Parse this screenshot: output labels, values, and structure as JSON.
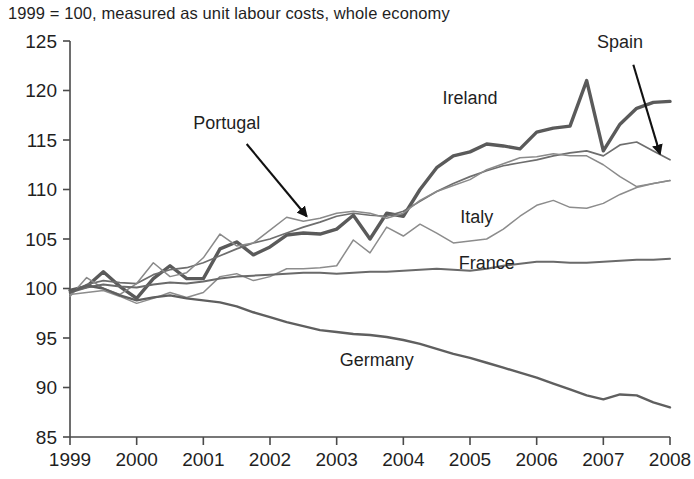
{
  "chart": {
    "title": "1999 = 100, measured as unit labour costs, whole economy"
  },
  "chart_data": {
    "type": "line",
    "title": "1999 = 100, measured as unit labour costs, whole economy",
    "xlabel": "",
    "ylabel": "",
    "xlim": [
      1999,
      2008
    ],
    "ylim": [
      85,
      125
    ],
    "yticks": [
      85,
      90,
      95,
      100,
      105,
      110,
      115,
      120,
      125
    ],
    "xticks": [
      1999,
      2000,
      2001,
      2002,
      2003,
      2004,
      2005,
      2006,
      2007,
      2008
    ],
    "grid": false,
    "legend": "inline-annotations",
    "x": [
      1999,
      1999.25,
      1999.5,
      1999.75,
      2000,
      2000.25,
      2000.5,
      2000.75,
      2001,
      2001.25,
      2001.5,
      2001.75,
      2002,
      2002.25,
      2002.5,
      2002.75,
      2003,
      2003.25,
      2003.5,
      2003.75,
      2004,
      2004.25,
      2004.5,
      2004.75,
      2005,
      2005.25,
      2005.5,
      2005.75,
      2006,
      2006.25,
      2006.5,
      2006.75,
      2007,
      2007.25,
      2007.5,
      2007.75,
      2008
    ],
    "series": [
      {
        "name": "Ireland",
        "color": "#5a5a5a",
        "width": 3.4,
        "label_x": 2005.0,
        "label_y": 118.6,
        "values": [
          99.8,
          100.2,
          101.7,
          100.2,
          99.0,
          101.0,
          102.3,
          101.0,
          101.0,
          104.0,
          104.7,
          103.4,
          104.2,
          105.4,
          105.6,
          105.5,
          106.0,
          107.4,
          105.0,
          107.6,
          107.3,
          110.0,
          112.2,
          113.4,
          113.8,
          114.6,
          114.4,
          114.1,
          115.8,
          116.2,
          116.4,
          121.0,
          113.9,
          116.6,
          118.2,
          118.8,
          118.9
        ]
      },
      {
        "name": "Spain",
        "color": "#6e6e6e",
        "width": 1.7,
        "label_x": 2007.25,
        "label_y": 124.3,
        "values": [
          99.5,
          100.4,
          100.8,
          100.6,
          100.5,
          101.4,
          101.9,
          102.1,
          102.6,
          103.3,
          104.0,
          104.6,
          105.0,
          105.6,
          106.2,
          106.7,
          107.3,
          107.6,
          107.4,
          107.3,
          107.8,
          108.8,
          109.8,
          110.6,
          111.3,
          111.9,
          112.4,
          112.7,
          113.0,
          113.4,
          113.7,
          113.9,
          113.4,
          114.5,
          114.8,
          113.9,
          113.0
        ]
      },
      {
        "name": "Portugal",
        "color": "#8a8a8a",
        "width": 1.5,
        "label_x": 2001.35,
        "label_y": 116.1,
        "values": [
          99.2,
          101.1,
          100.0,
          99.4,
          100.5,
          102.6,
          101.2,
          101.6,
          103.1,
          105.5,
          104.3,
          104.6,
          105.9,
          107.2,
          106.8,
          107.1,
          107.6,
          107.8,
          107.6,
          107.1,
          107.6,
          108.9,
          109.8,
          110.4,
          111.0,
          112.0,
          112.6,
          113.2,
          113.3,
          113.6,
          113.4,
          113.4,
          112.5,
          111.3,
          110.3,
          110.6,
          110.9
        ]
      },
      {
        "name": "Italy",
        "color": "#8c8c8c",
        "width": 1.5,
        "label_x": 2005.1,
        "label_y": 106.6,
        "values": [
          99.4,
          99.6,
          99.8,
          99.2,
          98.5,
          99.0,
          99.6,
          99.1,
          99.6,
          101.2,
          101.5,
          100.8,
          101.2,
          102.0,
          102.0,
          102.1,
          102.3,
          104.9,
          103.6,
          106.2,
          105.3,
          106.5,
          105.6,
          104.6,
          104.8,
          105.0,
          106.0,
          107.3,
          108.4,
          108.9,
          108.2,
          108.1,
          108.6,
          109.5,
          110.2,
          110.6,
          110.9
        ]
      },
      {
        "name": "France",
        "color": "#6a6a6a",
        "width": 2.0,
        "label_x": 2005.25,
        "label_y": 102.0,
        "values": [
          99.6,
          100.1,
          100.4,
          100.2,
          100.1,
          100.4,
          100.6,
          100.5,
          100.7,
          101.0,
          101.2,
          101.3,
          101.4,
          101.5,
          101.6,
          101.6,
          101.5,
          101.6,
          101.7,
          101.7,
          101.8,
          101.9,
          102.0,
          101.9,
          101.8,
          102.0,
          102.3,
          102.5,
          102.7,
          102.7,
          102.6,
          102.6,
          102.7,
          102.8,
          102.9,
          102.9,
          103.0
        ]
      },
      {
        "name": "Germany",
        "color": "#5f5f5f",
        "width": 2.4,
        "label_x": 2003.6,
        "label_y": 92.2,
        "values": [
          99.6,
          100.3,
          100.0,
          99.3,
          98.8,
          99.1,
          99.3,
          99.0,
          98.8,
          98.6,
          98.2,
          97.6,
          97.1,
          96.6,
          96.2,
          95.8,
          95.6,
          95.4,
          95.3,
          95.1,
          94.8,
          94.4,
          93.9,
          93.4,
          93.0,
          92.5,
          92.0,
          91.5,
          91.0,
          90.4,
          89.8,
          89.2,
          88.8,
          89.3,
          89.2,
          88.5,
          88.0
        ]
      }
    ],
    "annotations": [
      {
        "text": "Portugal",
        "arrow_from": [
          2001.65,
          114.6
        ],
        "arrow_to": [
          2002.55,
          107.3
        ]
      },
      {
        "text": "Spain",
        "arrow_from": [
          2007.45,
          122.6
        ],
        "arrow_to": [
          2007.85,
          113.6
        ]
      }
    ]
  }
}
